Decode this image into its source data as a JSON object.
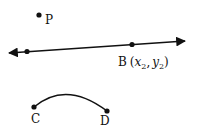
{
  "diagram": {
    "point_p": {
      "label": "P",
      "x": 39,
      "y": 15
    },
    "line": {
      "x1": 8,
      "y1": 53,
      "x2": 185,
      "y2": 41,
      "points": [
        {
          "label": "",
          "x": 27,
          "y": 51
        },
        {
          "label": "B",
          "x": 132,
          "y": 44
        }
      ]
    },
    "point_b_label": {
      "name": "B",
      "open": "(",
      "x_var": "x",
      "x_sub": "2",
      "comma": ",",
      "y_var": "y",
      "y_sub": "2",
      "close": ")"
    },
    "arc": {
      "start": {
        "label": "C",
        "x": 34,
        "y": 107
      },
      "end": {
        "label": "D",
        "x": 107,
        "y": 111
      }
    },
    "colors": {
      "stroke": "#111111",
      "background": "#ffffff"
    }
  }
}
